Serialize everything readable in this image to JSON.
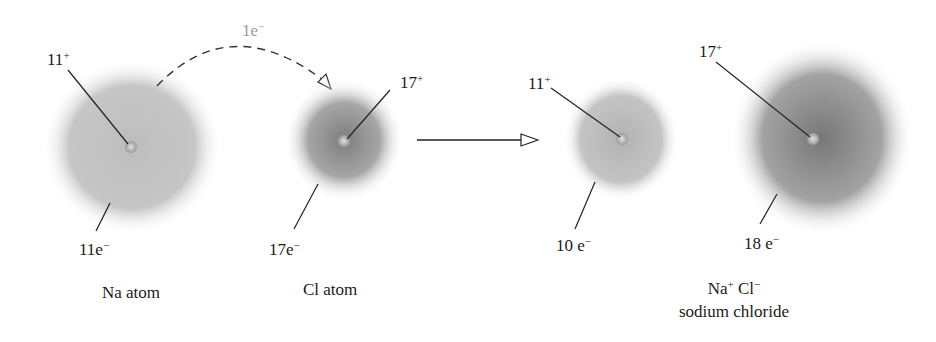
{
  "diagram": {
    "type": "ionic-bond-formation",
    "transfer_label": {
      "text": "1e",
      "sup": "−",
      "color": "#9a9a9a"
    },
    "atoms": [
      {
        "id": "na-atom",
        "nucleus": "11",
        "nucleus_sup": "+",
        "electrons": "11e",
        "electrons_sup": "−",
        "caption": "Na atom"
      },
      {
        "id": "cl-atom",
        "nucleus": "17",
        "nucleus_sup": "+",
        "electrons": "17e",
        "electrons_sup": "−",
        "caption": "Cl atom"
      }
    ],
    "ions": [
      {
        "id": "na-ion",
        "nucleus": "11",
        "nucleus_sup": "+",
        "electrons": "10 e",
        "electrons_sup": "−"
      },
      {
        "id": "cl-ion",
        "nucleus": "17",
        "nucleus_sup": "+",
        "electrons": "18 e",
        "electrons_sup": "−"
      }
    ],
    "product": {
      "formula_na": "Na",
      "formula_na_sup": "+",
      "formula_cl": " Cl",
      "formula_cl_sup": "−",
      "name": "sodium chloride"
    },
    "colors": {
      "cloud_light": "#c8c8c8",
      "cloud_dark": "#8a8a8a",
      "line": "#222222"
    }
  }
}
